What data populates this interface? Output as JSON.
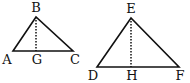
{
  "diagram": {
    "colors": {
      "stroke": "#111111",
      "background": "#ffffff"
    },
    "triangles": [
      {
        "name": "ABC",
        "vertices": {
          "A": [
            13,
            51
          ],
          "B": [
            36,
            17
          ],
          "C": [
            73,
            51
          ]
        },
        "foot": {
          "G": [
            36,
            51
          ]
        },
        "altitude": "BG",
        "labels": {
          "A": "A",
          "B": "B",
          "C": "C",
          "G": "G"
        }
      },
      {
        "name": "DEF",
        "vertices": {
          "D": [
            97,
            67
          ],
          "E": [
            131,
            18
          ],
          "F": [
            179,
            67
          ]
        },
        "foot": {
          "H": [
            131,
            67
          ]
        },
        "altitude": "EH",
        "labels": {
          "D": "D",
          "E": "E",
          "F": "F",
          "H": "H"
        }
      }
    ]
  }
}
